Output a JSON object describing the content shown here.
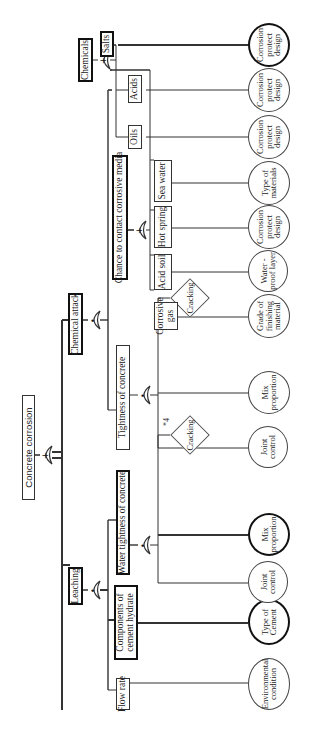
{
  "diagram": {
    "type": "fault tree",
    "orientation": "rotated 90 degrees counter-clockwise",
    "top_event": "Concrete corrosion",
    "level1": {
      "leaching": "Leaching",
      "chemical_attack": "Chemical attack"
    },
    "leaching_branch": {
      "components": "Components of cement hydrate",
      "flow_rate": "Flow rate",
      "water_tightness": "Water tightness of concrete",
      "type_of_cement": "Type of Cement",
      "environmental_condition": "Environmental condition",
      "joint_control": "Joint control",
      "mix_proportion": "Mix proportion",
      "cracking": "Cracking",
      "cracking_note": "*4"
    },
    "chemical_branch": {
      "tightness": "Tightness of concrete",
      "joint_control": "Joint control",
      "mix_proportion": "Mix proportion",
      "cracking": "Cracking",
      "cracking_note": "*4",
      "chance": "Chance to contact corrosive media",
      "corrosive_gas": "Corrosive gas",
      "acid_soil": "Acid soil",
      "hot_spring": "Hot spring",
      "sea_water": "Sea water",
      "chemicals": "Chemicals",
      "oils": "Oils",
      "acids": "Acids",
      "salts": "Salts",
      "grade_finishing": "Grade of finishing material",
      "water_proof": "Water -proof layer",
      "corrosion_protect_hot": "Corrosion protect design",
      "type_of_materials": "Type of materials",
      "corrosion_protect_oils": "Corrosion protect design",
      "corrosion_protect_acids": "Corrosion protect design",
      "corrosion_protect_salts": "Corrosion protect design"
    },
    "gates": {
      "or_symbol": "+",
      "and_symbol": "•"
    },
    "colors": {
      "line": "#333333",
      "thick_line": "#111111",
      "background": "#ffffff"
    }
  }
}
